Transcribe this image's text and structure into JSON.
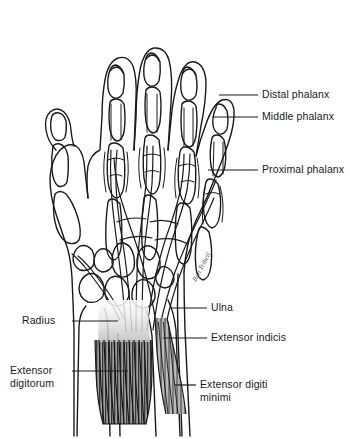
{
  "figure": {
    "background_color": "#ffffff",
    "ink_color": "#1a1a1a",
    "muscle_fill_color": "#9a9a9a",
    "tendon_fill_color": "#d8d8d8",
    "signature": "Ron Tribell"
  },
  "labels": {
    "distal_phalanx": "Distal phalanx",
    "middle_phalanx": "Middle phalanx",
    "proximal_phalanx": "Proximal phalanx",
    "ulna": "Ulna",
    "extensor_indicis": "Extensor indicis",
    "extensor_digiti_minimi": "Extensor digiti\nminimi",
    "radius": "Radius",
    "extensor_digitorum": "Extensor\ndigitorum"
  }
}
